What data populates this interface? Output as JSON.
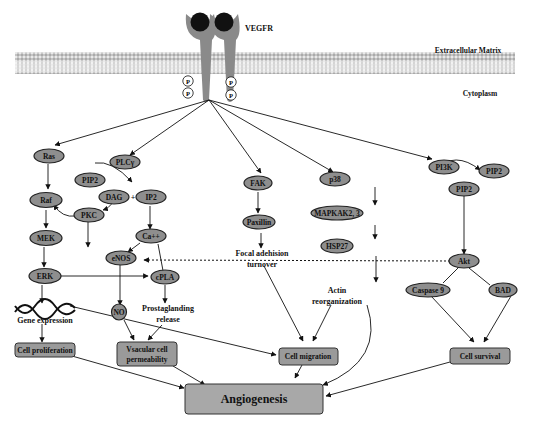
{
  "receptor": {
    "name": "VEGFR",
    "phospho_label": "P"
  },
  "regions": {
    "extracellular": "Extracellular Matrix",
    "cytoplasm": "Cytoplasm"
  },
  "nodes": {
    "ras": "Ras",
    "raf": "Raf",
    "mek": "MEK",
    "erk": "ERK",
    "plcg": "PLCγ",
    "pip2_a": "PIP2",
    "dag": "DAG",
    "ip2": "IP2",
    "plus": "+",
    "pkc": "PKC",
    "ca": "Ca++",
    "enos": "eNOS",
    "cpla": "cPLA",
    "no": "NO",
    "fak": "FAK",
    "paxillin": "Paxillin",
    "p38": "p38",
    "mapkak": "MAPKAK2, 3",
    "hsp27": "HSP27",
    "pi3k": "PI3K",
    "pip2_b": "PIP2",
    "pip2_c": "PIP2",
    "akt": "Akt",
    "caspase9": "Caspase 9",
    "bad": "BAD"
  },
  "labels": {
    "gene_expression": "Gene expression",
    "prostaglanding_1": "Prostaglanding",
    "prostaglanding_2": "release",
    "focal_1": "Focal adehision",
    "focal_2": "turnover",
    "actin_1": "Actin",
    "actin_2": "reorganization"
  },
  "outcomes": {
    "proliferation": "Cell proliferation",
    "permeability_1": "Vsacular cell",
    "permeability_2": "permeability",
    "migration": "Cell migration",
    "survival": "Cell survival",
    "angiogenesis": "Angiogenesis"
  }
}
